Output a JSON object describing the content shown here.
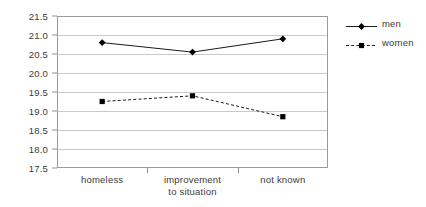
{
  "chart_data": {
    "type": "line",
    "title": "",
    "xlabel": "",
    "ylabel": "",
    "categories": [
      "homeless",
      "improvement to situation",
      "not known"
    ],
    "category_lines": [
      [
        "homeless"
      ],
      [
        "improvement",
        "to situation"
      ],
      [
        "not known"
      ]
    ],
    "series": [
      {
        "name": "men",
        "values": [
          20.8,
          20.55,
          20.9
        ],
        "marker": "diamond",
        "line_style": "solid",
        "color": "#000000"
      },
      {
        "name": "women",
        "values": [
          19.25,
          19.4,
          18.85
        ],
        "marker": "square",
        "line_style": "dashed",
        "color": "#000000"
      }
    ],
    "ylim": [
      17.5,
      21.5
    ],
    "ytick_step": 0.5,
    "yticks": [
      "17.5",
      "18.0",
      "18.5",
      "19.0",
      "19.5",
      "20.0",
      "20.5",
      "21.0",
      "21.5"
    ],
    "grid": true,
    "legend_position": "right"
  },
  "legend": {
    "entries": [
      {
        "label": "men",
        "marker_icon": "diamond-marker-icon",
        "line_style": "solid"
      },
      {
        "label": "women",
        "marker_icon": "square-marker-icon",
        "line_style": "dashed"
      }
    ]
  },
  "colors": {
    "plot_border": "#9a9a9a",
    "gridline": "#c9c9c9",
    "text": "#3a3a3a",
    "series_men": "#000000",
    "series_women": "#000000",
    "background": "#ffffff"
  }
}
